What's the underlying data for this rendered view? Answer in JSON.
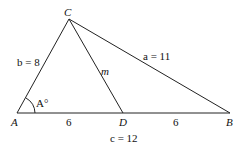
{
  "diagram": {
    "points": {
      "A": {
        "label": "A",
        "x": 17,
        "y": 113
      },
      "B": {
        "label": "B",
        "x": 230,
        "y": 113
      },
      "C": {
        "label": "C",
        "x": 69,
        "y": 19
      },
      "D": {
        "label": "D",
        "x": 123,
        "y": 113
      }
    },
    "labels": {
      "side_b": "b = 8",
      "side_a": "a = 11",
      "median": "m",
      "angle_A": "A°",
      "AD": "6",
      "DB": "6",
      "side_c": "c = 12"
    },
    "colors": {
      "stroke": "#222222",
      "text": "#111111"
    }
  }
}
